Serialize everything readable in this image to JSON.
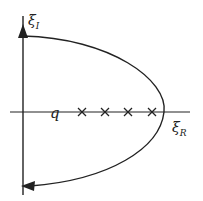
{
  "diagram": {
    "type": "complex-plane contour",
    "axes": {
      "vertical_label": "ξ",
      "vertical_sub": "I",
      "horizontal_label": "ξ",
      "horizontal_sub": "R"
    },
    "point_label": "q",
    "markers": {
      "symbol": "×",
      "count": 4
    },
    "contour": {
      "description": "closed contour: upward along imaginary axis, arcs right around the crosses on the real axis, returns leftward to the imaginary axis",
      "arrows": [
        "up on imaginary axis",
        "left at bottom of arc"
      ]
    },
    "colors": {
      "ink": "#222222",
      "background": "#ffffff"
    }
  }
}
